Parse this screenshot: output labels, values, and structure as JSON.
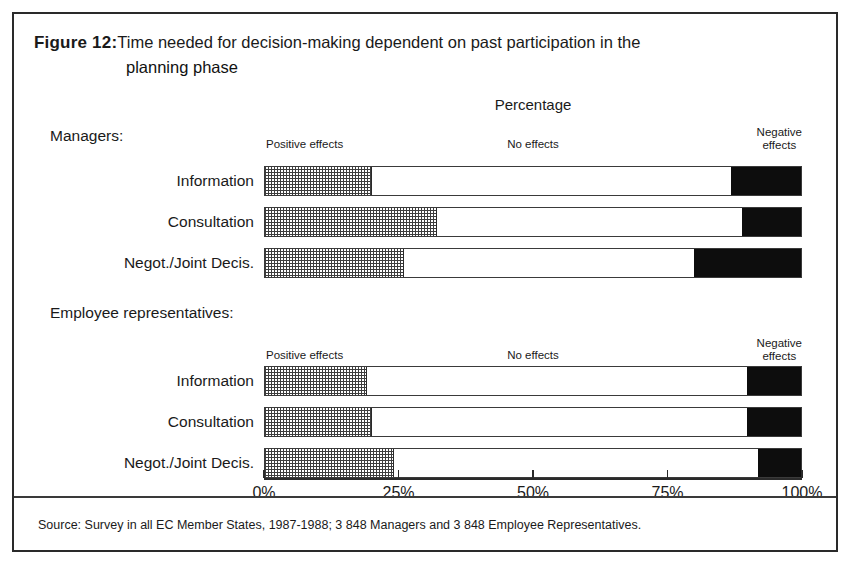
{
  "figure": {
    "label": "Figure 12:",
    "title_line1": "Time needed for decision-making dependent on past participation in the",
    "title_line2": "planning phase"
  },
  "chart_header": {
    "axis_title": "Percentage"
  },
  "segment_labels": {
    "positive": "Positive effects",
    "neutral": "No effects",
    "negative_line1": "Negative",
    "negative_line2": "effects"
  },
  "groups": [
    {
      "heading": "Managers:",
      "rows": [
        {
          "label": "Information",
          "positive": 20,
          "neutral": 67,
          "negative": 13
        },
        {
          "label": "Consultation",
          "positive": 32,
          "neutral": 57,
          "negative": 11
        },
        {
          "label": "Negot./Joint Decis.",
          "positive": 26,
          "neutral": 54,
          "negative": 20
        }
      ]
    },
    {
      "heading": "Employee representatives:",
      "rows": [
        {
          "label": "Information",
          "positive": 19,
          "neutral": 71,
          "negative": 10
        },
        {
          "label": "Consultation",
          "positive": 20,
          "neutral": 70,
          "negative": 10
        },
        {
          "label": "Negot./Joint Decis.",
          "positive": 24,
          "neutral": 68,
          "negative": 8
        }
      ]
    }
  ],
  "axis": {
    "ticks": [
      "0%",
      "25%",
      "50%",
      "75%",
      "100%"
    ],
    "tick_values": [
      0,
      25,
      50,
      75,
      100
    ],
    "min": 0,
    "max": 100
  },
  "footer": {
    "source": "Source: Survey in all EC Member States, 1987-1988; 3 848 Managers and 3 848 Employee Representatives."
  },
  "colors": {
    "frame": "#2a2a2a",
    "positive_hatch": "#3d3d3d",
    "neutral_fill": "#ffffff",
    "negative_fill": "#0d0d0d",
    "text": "#1a1a1a"
  },
  "chart_data": {
    "type": "bar",
    "orientation": "horizontal",
    "stacked": true,
    "normalized_percent": true,
    "title": "Time needed for decision-making dependent on past participation in the planning phase",
    "xlabel": "Percentage",
    "ylabel": "",
    "xlim": [
      0,
      100
    ],
    "xticks": [
      0,
      25,
      50,
      75,
      100
    ],
    "xticklabels": [
      "0%",
      "25%",
      "50%",
      "75%",
      "100%"
    ],
    "grid": false,
    "legend_position": "above-bars-inline",
    "legend": [
      "Positive effects",
      "No effects",
      "Negative effects"
    ],
    "groups": [
      "Managers:",
      "Employee representatives:"
    ],
    "categories": [
      "Managers: Information",
      "Managers: Consultation",
      "Managers: Negot./Joint Decis.",
      "Employee representatives: Information",
      "Employee representatives: Consultation",
      "Employee representatives: Negot./Joint Decis."
    ],
    "series": [
      {
        "name": "Positive effects",
        "values": [
          20,
          32,
          26,
          19,
          20,
          24
        ]
      },
      {
        "name": "No effects",
        "values": [
          67,
          57,
          54,
          71,
          70,
          68
        ]
      },
      {
        "name": "Negative effects",
        "values": [
          13,
          11,
          20,
          10,
          10,
          8
        ]
      }
    ],
    "annotations": [
      "Source: Survey in all EC Member States, 1987-1988; 3 848 Managers and 3 848 Employee Representatives."
    ]
  }
}
